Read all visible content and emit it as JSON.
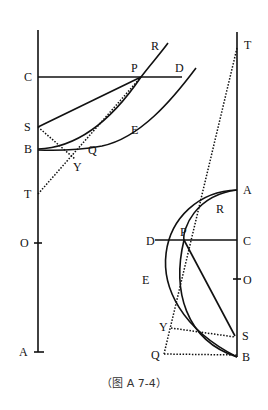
{
  "figure": {
    "caption": "（图 A 7-4）",
    "ink_color": "#111111",
    "background": "#ffffff"
  },
  "left_diagram": {
    "labels": {
      "C": "C",
      "S": "S",
      "B": "B",
      "T": "T",
      "O": "O",
      "A": "A",
      "P": "P",
      "D": "D",
      "R": "R",
      "E": "E",
      "Q": "Q",
      "Y": "Y"
    }
  },
  "right_diagram": {
    "labels": {
      "T": "T",
      "A": "A",
      "R": "R",
      "D": "D",
      "P": "P",
      "C": "C",
      "E": "E",
      "O": "O",
      "Y": "Y",
      "S": "S",
      "Q": "Q",
      "B": "B"
    }
  }
}
